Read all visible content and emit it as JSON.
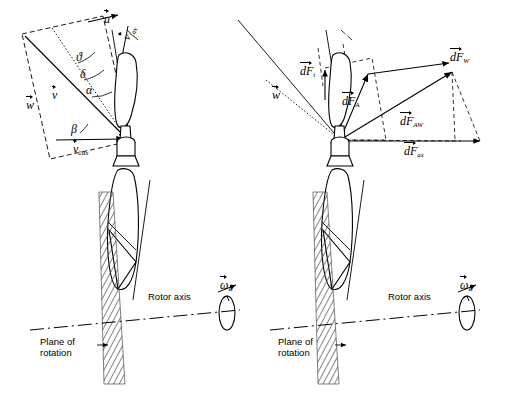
{
  "figure": {
    "panels": [
      {
        "id": "left",
        "name": "velocity-triangle-panel",
        "labels": [
          {
            "key": "v2ax",
            "text": "v",
            "sub": "2ax",
            "vector": true,
            "x": 73,
            "y": 148
          },
          {
            "key": "v",
            "text": "v",
            "sub": "",
            "vector": true,
            "x": 52,
            "y": 95
          },
          {
            "key": "w",
            "text": "w",
            "sub": "",
            "vector": true,
            "x": 26,
            "y": 105
          },
          {
            "key": "u",
            "text": "u",
            "sub": "",
            "vector": true,
            "x": 106,
            "y": 18
          },
          {
            "key": "v1ax",
            "text": "v",
            "sub": "1ax",
            "vector": true,
            "x": 122,
            "y": 44
          },
          {
            "key": "theta",
            "text": "ϑ",
            "sub": "",
            "vector": false,
            "x": 76,
            "y": 57
          },
          {
            "key": "delta",
            "text": "δ",
            "sub": "",
            "vector": false,
            "x": 80,
            "y": 74
          },
          {
            "key": "alpha",
            "text": "α",
            "sub": "",
            "vector": false,
            "x": 86,
            "y": 90
          },
          {
            "key": "beta",
            "text": "β",
            "sub": "",
            "vector": false,
            "x": 73,
            "y": 129
          }
        ],
        "annotations": [
          {
            "key": "rotor-axis",
            "text": "Rotor axis",
            "x": 148,
            "y": 297
          },
          {
            "key": "plane-of-rotation",
            "text": "Plane of",
            "text2": "rotation",
            "x": 58,
            "y": 342
          },
          {
            "key": "omega-r",
            "text": "ω",
            "sub": "R",
            "vector": true,
            "x": 222,
            "y": 289
          }
        ]
      },
      {
        "id": "right",
        "name": "force-diagram-panel",
        "labels": [
          {
            "key": "dFt",
            "text": "dF",
            "sub": "t",
            "vector": true,
            "x": 302,
            "y": 71
          },
          {
            "key": "dFA",
            "text": "dF",
            "sub": "A",
            "vector": true,
            "x": 345,
            "y": 101
          },
          {
            "key": "dFW",
            "text": "dF",
            "sub": "W",
            "vector": true,
            "x": 452,
            "y": 57
          },
          {
            "key": "dFAW",
            "text": "dF",
            "sub": "AW",
            "vector": true,
            "x": 404,
            "y": 121
          },
          {
            "key": "dFax",
            "text": "dF",
            "sub": "ax",
            "vector": true,
            "x": 407,
            "y": 150
          },
          {
            "key": "w",
            "text": "w",
            "sub": "",
            "vector": true,
            "x": 274,
            "y": 95
          }
        ],
        "annotations": [
          {
            "key": "rotor-axis",
            "text": "Rotor axis",
            "x": 388,
            "y": 297
          },
          {
            "key": "plane-of-rotation",
            "text": "Plane of",
            "text2": "rotation",
            "x": 296,
            "y": 342
          },
          {
            "key": "omega-r",
            "text": "ω",
            "sub": "R",
            "vector": true,
            "x": 462,
            "y": 289
          }
        ]
      }
    ],
    "colors": {
      "ink": "#000000",
      "background": "#ffffff",
      "hatch": "#555555"
    }
  }
}
